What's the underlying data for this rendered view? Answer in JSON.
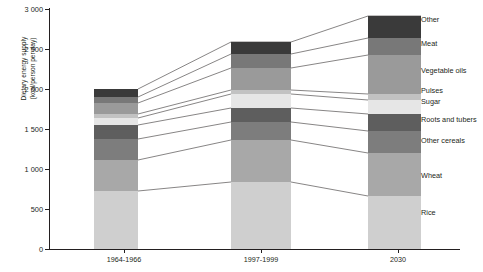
{
  "chart_data": {
    "type": "bar",
    "subtype": "stacked-bar",
    "title": "",
    "xlabel": "",
    "ylabel": "Dietary energy supply (kcal/person per day)",
    "ylabel_lines": [
      "Dietary energy supply",
      "(kcal/person per day)"
    ],
    "categories": [
      "1964-1966",
      "1997-1999",
      "2030"
    ],
    "ytick_labels": [
      "0",
      "500",
      "1 000",
      "1 500",
      "2 000",
      "2 500",
      "3 000"
    ],
    "ytick_values": [
      0,
      500,
      1000,
      1500,
      2000,
      2500,
      3000
    ],
    "ylim": [
      0,
      3000
    ],
    "grid": false,
    "legend_position": "right-inline",
    "series": [
      {
        "name": "Rice",
        "values": [
          700,
          810,
          830
        ],
        "color": "#cfcfcf"
      },
      {
        "name": "Wheat",
        "values": [
          370,
          510,
          520
        ],
        "color": "#a8a8a8"
      },
      {
        "name": "Other cereals",
        "values": [
          255,
          220,
          265
        ],
        "color": "#7d7d7d"
      },
      {
        "name": "Roots and tubers",
        "values": [
          170,
          170,
          205
        ],
        "color": "#5e5e5e"
      },
      {
        "name": "Sugar",
        "values": [
          85,
          170,
          170
        ],
        "color": "#e6e6e6"
      },
      {
        "name": "Pulses",
        "values": [
          48,
          48,
          73
        ],
        "color": "#c2c2c2"
      },
      {
        "name": "Vegetable oils",
        "values": [
          134,
          267,
          473
        ],
        "color": "#9a9a9a"
      },
      {
        "name": "Meat",
        "values": [
          73,
          170,
          206
        ],
        "color": "#787878"
      },
      {
        "name": "Other",
        "values": [
          97,
          146,
          267
        ],
        "color": "#3a3a3a"
      }
    ],
    "totals": [
      1932,
      2511,
      3009
    ],
    "stack_order_bottom_to_top": [
      "Rice",
      "Wheat",
      "Other cereals",
      "Roots and tubers",
      "Sugar",
      "Pulses",
      "Vegetable oils",
      "Meat",
      "Other"
    ],
    "legend_entries": [
      {
        "label": "Other",
        "color": "#3a3a3a"
      },
      {
        "label": "Meat",
        "color": "#787878"
      },
      {
        "label": "Vegetable oils",
        "color": "#9a9a9a"
      },
      {
        "label": "Pulses",
        "color": "#c2c2c2"
      },
      {
        "label": "Sugar",
        "color": "#e6e6e6"
      },
      {
        "label": "Roots and tubers",
        "color": "#5e5e5e"
      },
      {
        "label": "Other cereals",
        "color": "#7d7d7d"
      },
      {
        "label": "Wheat",
        "color": "#a8a8a8"
      },
      {
        "label": "Rice",
        "color": "#cfcfcf"
      }
    ]
  },
  "axis": {
    "y_ticks": [
      {
        "label": "3 000",
        "y": 9
      },
      {
        "label": "2 500",
        "y": 49
      },
      {
        "label": "2 000",
        "y": 89
      },
      {
        "label": "1 500",
        "y": 129
      },
      {
        "label": "1 000",
        "y": 169
      },
      {
        "label": "500",
        "y": 209
      },
      {
        "label": "0",
        "y": 249
      }
    ],
    "x_ticks": [
      {
        "label": "1964-1966",
        "x": 124
      },
      {
        "label": "1997-1999",
        "x": 261
      },
      {
        "label": "2030",
        "x": 398
      }
    ]
  },
  "bars": [
    {
      "category": "1964-1966",
      "left": 94,
      "width": 44,
      "segments": [
        {
          "name": "Other",
          "top": 89,
          "height": 8,
          "color": "#3a3a3a"
        },
        {
          "name": "Meat",
          "top": 97,
          "height": 6,
          "color": "#787878"
        },
        {
          "name": "Vegetable oils",
          "top": 103,
          "height": 11,
          "color": "#9a9a9a"
        },
        {
          "name": "Pulses",
          "top": 114,
          "height": 4,
          "color": "#c2c2c2"
        },
        {
          "name": "Sugar",
          "top": 118,
          "height": 7,
          "color": "#e6e6e6"
        },
        {
          "name": "Roots and tubers",
          "top": 125,
          "height": 14,
          "color": "#5e5e5e"
        },
        {
          "name": "Other cereals",
          "top": 139,
          "height": 21,
          "color": "#7d7d7d"
        },
        {
          "name": "Wheat",
          "top": 160,
          "height": 31,
          "color": "#a8a8a8"
        },
        {
          "name": "Rice",
          "top": 191,
          "height": 58,
          "color": "#cfcfcf"
        }
      ]
    },
    {
      "category": "1997-1999",
      "left": 231,
      "width": 60,
      "segments": [
        {
          "name": "Other",
          "top": 42,
          "height": 12,
          "color": "#3a3a3a"
        },
        {
          "name": "Meat",
          "top": 54,
          "height": 14,
          "color": "#787878"
        },
        {
          "name": "Vegetable oils",
          "top": 68,
          "height": 22,
          "color": "#9a9a9a"
        },
        {
          "name": "Pulses",
          "top": 90,
          "height": 4,
          "color": "#c2c2c2"
        },
        {
          "name": "Sugar",
          "top": 94,
          "height": 14,
          "color": "#e6e6e6"
        },
        {
          "name": "Roots and tubers",
          "top": 108,
          "height": 14,
          "color": "#5e5e5e"
        },
        {
          "name": "Other cereals",
          "top": 122,
          "height": 18,
          "color": "#7d7d7d"
        },
        {
          "name": "Wheat",
          "top": 140,
          "height": 42,
          "color": "#a8a8a8"
        },
        {
          "name": "Rice",
          "top": 182,
          "height": 67,
          "color": "#cfcfcf"
        }
      ]
    },
    {
      "category": "2030",
      "left": 368,
      "width": 53,
      "segments": [
        {
          "name": "Other",
          "top": 16,
          "height": 22,
          "color": "#3a3a3a"
        },
        {
          "name": "Meat",
          "top": 38,
          "height": 17,
          "color": "#787878"
        },
        {
          "name": "Vegetable oils",
          "top": 55,
          "height": 39,
          "color": "#9a9a9a"
        },
        {
          "name": "Pulses",
          "top": 94,
          "height": 6,
          "color": "#c2c2c2"
        },
        {
          "name": "Sugar",
          "top": 100,
          "height": 14,
          "color": "#e6e6e6"
        },
        {
          "name": "Roots and tubers",
          "top": 114,
          "height": 17,
          "color": "#5e5e5e"
        },
        {
          "name": "Other cereals",
          "top": 131,
          "height": 22,
          "color": "#7d7d7d"
        },
        {
          "name": "Wheat",
          "top": 153,
          "height": 43,
          "color": "#a8a8a8"
        },
        {
          "name": "Rice",
          "top": 196,
          "height": 53,
          "color": "#cfcfcf"
        }
      ]
    }
  ],
  "legend_layout": [
    {
      "label": "Other",
      "y": 19
    },
    {
      "label": "Meat",
      "y": 43
    },
    {
      "label": "Vegetable oils",
      "y": 70
    },
    {
      "label": "Pulses",
      "y": 90
    },
    {
      "label": "Sugar",
      "y": 101
    },
    {
      "label": "Roots and tubers",
      "y": 119
    },
    {
      "label": "Other cereals",
      "y": 140
    },
    {
      "label": "Wheat",
      "y": 175
    },
    {
      "label": "Rice",
      "y": 212
    }
  ],
  "leader_lines": [
    {
      "name": "other-top",
      "points": "138,89 231,42 291,42 368,16 421,16"
    },
    {
      "name": "other-meat",
      "points": "138,97 231,54 291,54 368,38 421,40"
    },
    {
      "name": "meat-veg",
      "points": "138,103 231,68 291,68 368,55 421,64"
    },
    {
      "name": "veg-pulses",
      "points": "138,114 231,90 291,90 368,94 421,87"
    },
    {
      "name": "pulses-sugar",
      "points": "138,118 231,94 291,94 368,100 421,98"
    },
    {
      "name": "sugar-roots",
      "points": "138,125 231,108 291,108 368,114 421,116"
    },
    {
      "name": "roots-cereals",
      "points": "138,139 231,122 291,122 368,131 421,137"
    },
    {
      "name": "cereals-wheat",
      "points": "138,160 231,140 291,140 368,153 421,172"
    },
    {
      "name": "wheat-rice",
      "points": "138,191 231,182 291,182 368,196 421,209"
    }
  ]
}
